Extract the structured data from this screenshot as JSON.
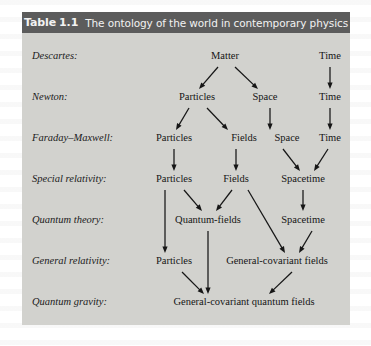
{
  "figure": {
    "header": {
      "label": "Table",
      "number": "1.1",
      "title": "The ontology of the world in contemporary physics"
    },
    "colors": {
      "header_bg": "#5c5c5c",
      "header_text": "#f2f2f2",
      "body_bg": "#d2d2ce",
      "text": "#151515",
      "arrow": "#161616"
    },
    "rows": [
      {
        "label": "Descartes:",
        "y": 24,
        "nodes": [
          {
            "text": "Matter",
            "x": 203
          },
          {
            "text": "Time",
            "x": 308
          }
        ]
      },
      {
        "label": "Newton:",
        "y": 65,
        "nodes": [
          {
            "text": "Particles",
            "x": 175
          },
          {
            "text": "Space",
            "x": 243
          },
          {
            "text": "Time",
            "x": 308
          }
        ]
      },
      {
        "label": "Faraday–Maxwell:",
        "y": 106,
        "nodes": [
          {
            "text": "Particles",
            "x": 152
          },
          {
            "text": "Fields",
            "x": 222
          },
          {
            "text": "Space",
            "x": 265
          },
          {
            "text": "Time",
            "x": 308
          }
        ]
      },
      {
        "label": "Special relativity:",
        "y": 147,
        "nodes": [
          {
            "text": "Particles",
            "x": 152
          },
          {
            "text": "Fields",
            "x": 214
          },
          {
            "text": "Spacetime",
            "x": 281
          }
        ]
      },
      {
        "label": "Quantum theory:",
        "y": 188,
        "nodes": [
          {
            "text": "Quantum-fields",
            "x": 186
          },
          {
            "text": "Spacetime",
            "x": 281
          }
        ]
      },
      {
        "label": "General relativity:",
        "y": 229,
        "nodes": [
          {
            "text": "Particles",
            "x": 152
          },
          {
            "text": "General-covariant fields",
            "x": 255
          }
        ]
      },
      {
        "label": "Quantum gravity:",
        "y": 270,
        "nodes": [
          {
            "text": "General-covariant quantum fields",
            "x": 222
          }
        ]
      }
    ],
    "arrows": [
      {
        "name": "matter-to-particles",
        "x1": 196,
        "y1": 34,
        "x2": 177,
        "y2": 56
      },
      {
        "name": "matter-to-space",
        "x1": 213,
        "y1": 34,
        "x2": 236,
        "y2": 56
      },
      {
        "name": "time-to-time-1",
        "x1": 308,
        "y1": 34,
        "x2": 308,
        "y2": 56
      },
      {
        "name": "particles-to-particles-1",
        "x1": 167,
        "y1": 75,
        "x2": 154,
        "y2": 97
      },
      {
        "name": "particles-to-fields",
        "x1": 185,
        "y1": 75,
        "x2": 206,
        "y2": 97
      },
      {
        "name": "space-to-space",
        "x1": 248,
        "y1": 75,
        "x2": 248,
        "y2": 97
      },
      {
        "name": "time-to-time-2",
        "x1": 308,
        "y1": 75,
        "x2": 308,
        "y2": 97
      },
      {
        "name": "particles-to-particles-2",
        "x1": 152,
        "y1": 116,
        "x2": 152,
        "y2": 138
      },
      {
        "name": "fields-to-fields",
        "x1": 214,
        "y1": 116,
        "x2": 214,
        "y2": 138
      },
      {
        "name": "space-to-spacetime",
        "x1": 261,
        "y1": 116,
        "x2": 278,
        "y2": 138
      },
      {
        "name": "time-to-spacetime",
        "x1": 306,
        "y1": 116,
        "x2": 292,
        "y2": 138
      },
      {
        "name": "particles-down-long",
        "x1": 143,
        "y1": 157,
        "x2": 143,
        "y2": 220
      },
      {
        "name": "particles-to-quantum-fields",
        "x1": 162,
        "y1": 157,
        "x2": 180,
        "y2": 178
      },
      {
        "name": "fields-to-quantum-fields",
        "x1": 210,
        "y1": 157,
        "x2": 194,
        "y2": 178
      },
      {
        "name": "fields-to-gc-fields",
        "x1": 226,
        "y1": 157,
        "x2": 263,
        "y2": 220
      },
      {
        "name": "spacetime-to-spacetime",
        "x1": 281,
        "y1": 157,
        "x2": 281,
        "y2": 178
      },
      {
        "name": "quantum-fields-down-long",
        "x1": 186,
        "y1": 198,
        "x2": 186,
        "y2": 261
      },
      {
        "name": "spacetime-to-gc-fields",
        "x1": 290,
        "y1": 198,
        "x2": 277,
        "y2": 220
      },
      {
        "name": "particles-to-gcqf",
        "x1": 160,
        "y1": 239,
        "x2": 182,
        "y2": 261
      },
      {
        "name": "gc-fields-to-gcqf",
        "x1": 270,
        "y1": 239,
        "x2": 247,
        "y2": 261
      }
    ]
  }
}
